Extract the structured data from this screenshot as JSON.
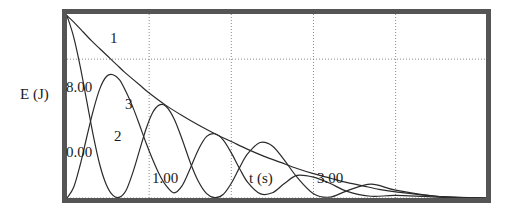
{
  "axes": {
    "ylabel": "E (J)",
    "xlabel": "t (s)",
    "yticks": [
      "8.00",
      "0.00"
    ],
    "xticks": [
      "1.00",
      "3.00"
    ]
  },
  "curve_labels": {
    "one": "1",
    "two": "2",
    "three": "3"
  },
  "colors": {
    "curve": "#2b2b2b",
    "grid": "#8a8a8a",
    "frame": "#555555",
    "background": "#ffffff"
  },
  "chart_data": {
    "type": "line",
    "title": "",
    "xlabel": "t (s)",
    "ylabel": "E (J)",
    "xlim": [
      0,
      5.1
    ],
    "ylim": [
      0,
      10.6
    ],
    "xticks": [
      1.0,
      3.0
    ],
    "xticklabels": [
      "1.00",
      "3.00"
    ],
    "yticks": [
      0.0,
      8.0
    ],
    "yticklabels": [
      "0.00",
      "8.00"
    ],
    "gridlines": {
      "vertical_x": [
        1.0,
        2.0,
        3.0,
        4.0
      ],
      "horizontal_y": [
        0.0,
        8.0
      ],
      "style": "dotted",
      "on": true
    },
    "legend": "inline curve numbers 1, 2, 3",
    "series": [
      {
        "name": "1",
        "label_position": {
          "x": 0.55,
          "y": 8.6
        },
        "description": "total-energy envelope, monotonic decay from 10.5 J to 0",
        "x": [
          0.0,
          0.1,
          0.2,
          0.3,
          0.4,
          0.5,
          0.6,
          0.7,
          0.8,
          0.9,
          1.0,
          1.2,
          1.4,
          1.6,
          1.8,
          2.0,
          2.2,
          2.4,
          2.6,
          2.8,
          3.0,
          3.2,
          3.4,
          3.6,
          3.8,
          4.0,
          4.5,
          5.1
        ],
        "y": [
          10.5,
          10.05,
          9.55,
          9.05,
          8.6,
          8.15,
          7.7,
          7.25,
          6.85,
          6.45,
          6.05,
          5.35,
          4.75,
          4.2,
          3.7,
          3.25,
          2.8,
          2.4,
          2.05,
          1.7,
          1.4,
          1.15,
          0.9,
          0.7,
          0.5,
          0.35,
          0.1,
          0.0
        ]
      },
      {
        "name": "2",
        "label_position": {
          "x": 0.6,
          "y": 2.5
        },
        "description": "oscillator A energy: starts at maximum 10.5 J, decaying cosine-squared oscillation touching 0",
        "x": [
          0.0,
          0.08,
          0.16,
          0.24,
          0.32,
          0.4,
          0.48,
          0.56,
          0.64,
          0.72,
          0.8,
          0.88,
          0.96,
          1.04,
          1.12,
          1.2,
          1.3,
          1.4,
          1.5,
          1.6,
          1.7,
          1.8,
          1.9,
          2.0,
          2.1,
          2.2,
          2.35,
          2.5,
          2.65,
          2.8,
          3.0,
          3.2,
          3.4,
          3.7,
          4.0,
          4.5,
          5.1
        ],
        "y": [
          10.5,
          9.3,
          7.6,
          5.6,
          3.6,
          1.9,
          0.75,
          0.15,
          0.05,
          0.45,
          1.45,
          2.7,
          3.95,
          4.9,
          5.35,
          5.3,
          4.6,
          3.4,
          2.05,
          0.95,
          0.25,
          0.02,
          0.2,
          0.85,
          1.75,
          2.55,
          3.2,
          3.0,
          2.15,
          1.2,
          0.25,
          0.05,
          0.4,
          0.8,
          0.45,
          0.1,
          0.0
        ]
      },
      {
        "name": "3",
        "label_position": {
          "x": 0.43,
          "y": 4.9
        },
        "description": "oscillator B energy: starts at 0, out of phase with curve 2, peaks where curve 2 is minimum",
        "x": [
          0.0,
          0.08,
          0.16,
          0.24,
          0.32,
          0.4,
          0.48,
          0.56,
          0.64,
          0.72,
          0.8,
          0.88,
          0.96,
          1.04,
          1.12,
          1.2,
          1.3,
          1.4,
          1.5,
          1.6,
          1.7,
          1.8,
          1.9,
          2.0,
          2.1,
          2.2,
          2.35,
          2.5,
          2.65,
          2.8,
          3.0,
          3.2,
          3.4,
          3.7,
          4.0,
          4.5,
          5.1
        ],
        "y": [
          0.0,
          0.6,
          1.9,
          3.5,
          5.05,
          6.3,
          7.0,
          7.1,
          6.8,
          6.1,
          5.25,
          4.25,
          3.2,
          2.25,
          1.4,
          0.75,
          0.3,
          0.7,
          1.7,
          2.8,
          3.55,
          3.7,
          3.35,
          2.6,
          1.7,
          0.9,
          0.25,
          0.3,
          0.85,
          1.3,
          1.2,
          0.85,
          0.4,
          0.1,
          0.15,
          0.05,
          0.0
        ]
      }
    ]
  }
}
